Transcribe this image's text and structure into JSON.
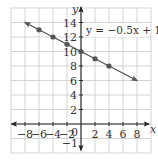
{
  "chart_data": {
    "type": "line",
    "title": "",
    "xlabel": "x",
    "ylabel": "y",
    "xlim": [
      -10,
      10
    ],
    "ylim": [
      -4,
      16
    ],
    "grid": true,
    "grid_step": 2,
    "x_tick_labels": [
      "-8",
      "-6",
      "-4",
      "-2",
      "0",
      "2",
      "4",
      "6",
      "8"
    ],
    "x_ticks": [
      -8,
      -6,
      -4,
      -2,
      2,
      4,
      6,
      8
    ],
    "y_tick_labels": [
      "2",
      "4",
      "6",
      "8",
      "10",
      "12",
      "14",
      "-1"
    ],
    "y_ticks": [
      2,
      4,
      6,
      8,
      10,
      12,
      14
    ],
    "origin_label": "0",
    "extra_label": "-1",
    "equation": "y = −0.5x + 10",
    "series": [
      {
        "name": "y = -0.5x + 10",
        "slope": -0.5,
        "intercept": 10,
        "line_x_range": [
          -8,
          8
        ],
        "arrows": "both",
        "points": [
          {
            "x": -6,
            "y": 13
          },
          {
            "x": -4,
            "y": 12
          },
          {
            "x": -2,
            "y": 11
          },
          {
            "x": 0,
            "y": 10
          },
          {
            "x": 2,
            "y": 9
          },
          {
            "x": 4,
            "y": 8
          }
        ],
        "color": "#555555"
      }
    ],
    "legend": "annotation top-right",
    "colors": {
      "grid": "#c8c8c8",
      "axis": "#222222",
      "line": "#555555",
      "point": "#555555",
      "text": "#333333"
    }
  }
}
